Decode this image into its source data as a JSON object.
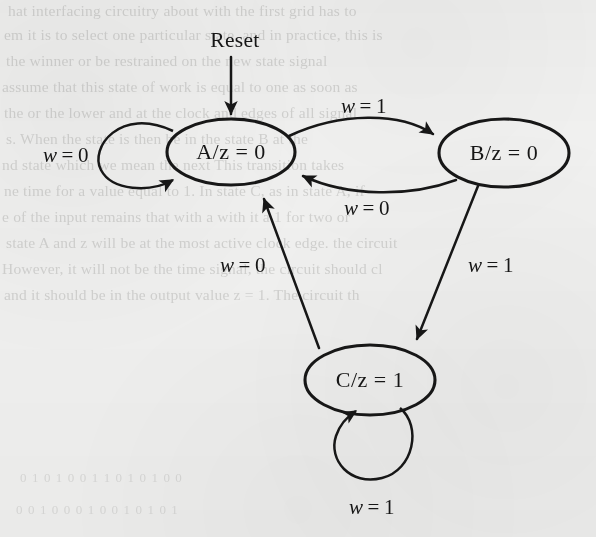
{
  "figure": {
    "kind": "finite-state-machine-state-diagram",
    "machine_type": "Moore",
    "input_variable": "w",
    "output_variable": "z",
    "background_color": "#f1f1f0",
    "ink_color": "#171717",
    "reset_label": "Reset"
  },
  "states": [
    {
      "id": "A",
      "label": "A/z = 0",
      "name": "A",
      "output": "0",
      "cx": 231,
      "cy": 152,
      "rx": 64,
      "ry": 33,
      "is_initial": true
    },
    {
      "id": "B",
      "label": "B/z = 0",
      "name": "B",
      "output": "0",
      "cx": 504,
      "cy": 153,
      "rx": 65,
      "ry": 34,
      "is_initial": false
    },
    {
      "id": "C",
      "label": "C/z = 1",
      "name": "C",
      "output": "1",
      "cx": 370,
      "cy": 380,
      "rx": 65,
      "ry": 35,
      "is_initial": false
    }
  ],
  "transitions": [
    {
      "id": "A-to-A",
      "from": "A",
      "to": "A",
      "condition": "w = 0",
      "var": "w",
      "eq": "=",
      "value": "0",
      "label_x": 66,
      "label_y": 155,
      "kind": "self-loop"
    },
    {
      "id": "A-to-B",
      "from": "A",
      "to": "B",
      "condition": "w = 1",
      "var": "w",
      "eq": "=",
      "value": "1",
      "label_x": 364,
      "label_y": 106,
      "kind": "curve"
    },
    {
      "id": "B-to-A",
      "from": "B",
      "to": "A",
      "condition": "w = 0",
      "var": "w",
      "eq": "=",
      "value": "0",
      "label_x": 367,
      "label_y": 208,
      "kind": "curve"
    },
    {
      "id": "B-to-C",
      "from": "B",
      "to": "C",
      "condition": "w = 1",
      "var": "w",
      "eq": "=",
      "value": "1",
      "label_x": 491,
      "label_y": 265,
      "kind": "straight"
    },
    {
      "id": "C-to-A",
      "from": "C",
      "to": "A",
      "condition": "w = 0",
      "var": "w",
      "eq": "=",
      "value": "0",
      "label_x": 243,
      "label_y": 265,
      "kind": "straight"
    },
    {
      "id": "C-to-C",
      "from": "C",
      "to": "C",
      "condition": "w = 1",
      "var": "w",
      "eq": "=",
      "value": "1",
      "label_x": 372,
      "label_y": 507,
      "kind": "self-loop"
    }
  ],
  "reset_arrow": {
    "label": "Reset",
    "label_x": 235,
    "label_y": 40,
    "target_state": "A"
  },
  "ghost_text": {
    "note": "faint bleed-through text from the reverse side of the scanned page",
    "top_lines": [
      "hat interfacing circuitry about with the first grid has to",
      "em it is to select one particular state, and in practice, this is",
      "the winner or be restrained on the new state signal",
      "assume that this state of work is equal to one as soon as",
      "the or the lower and at the clock and edges of all signal",
      "s. When the state is then be in the state B at the",
      "nd state which we mean the next This transition takes",
      "ne time for a value equal to 1. In state C, as in state A, if",
      "e of the input remains that with a with it a 1 for two or",
      "state A and z will be at the most active clock edge. the circuit",
      "However, it will not be the time signal, the circuit should cl",
      "and it should be in the output value z = 1. The circuit th"
    ],
    "bottom_lines": [
      "0  1  0  1  0  0  1  1  0  1  0  1  0  0",
      "0  0  1  0  0  0  1  0  0  1  0  1  0  1"
    ]
  }
}
